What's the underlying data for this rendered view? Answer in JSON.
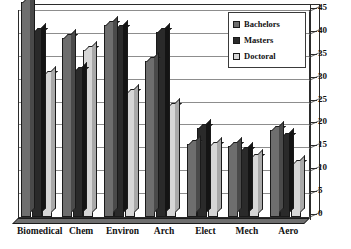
{
  "chart_data": {
    "type": "bar",
    "title": "",
    "subtitle": "",
    "xlabel": "",
    "ylabel": "",
    "ylim": [
      0,
      45
    ],
    "ytick_step": 5,
    "yticks": [
      0,
      5,
      10,
      15,
      20,
      25,
      30,
      35,
      40,
      45
    ],
    "grid": true,
    "grid_axis": "y",
    "legend_position": "top-right",
    "three_d": true,
    "categories": [
      "Biomedical",
      "Chem",
      "Environ",
      "Arch",
      "Elect",
      "Mech",
      "Aero"
    ],
    "series": [
      {
        "name": "Bachelors",
        "color": "#6e6e6e",
        "values": [
          47,
          39,
          42,
          34,
          16,
          15.5,
          19
        ]
      },
      {
        "name": "Masters",
        "color": "#2a2a2a",
        "values": [
          40.5,
          32,
          41,
          40.5,
          19.5,
          14.5,
          17.5
        ]
      },
      {
        "name": "Doctoral",
        "color": "#d6d6d6",
        "values": [
          31,
          36.5,
          27,
          24,
          15.5,
          13,
          11.5
        ]
      }
    ]
  },
  "legend": {
    "items": [
      {
        "label": "Bachelors",
        "swatch_class": "lg-bach"
      },
      {
        "label": "Masters",
        "swatch_class": "lg-mast"
      },
      {
        "label": "Doctoral",
        "swatch_class": "lg-doct"
      }
    ]
  },
  "colors": {
    "bachelors": "#6e6e6e",
    "masters": "#2a2a2a",
    "doctoral": "#d6d6d6",
    "axis": "#2b2b2b",
    "grid": "#8d8d8d",
    "background": "#ffffff"
  }
}
